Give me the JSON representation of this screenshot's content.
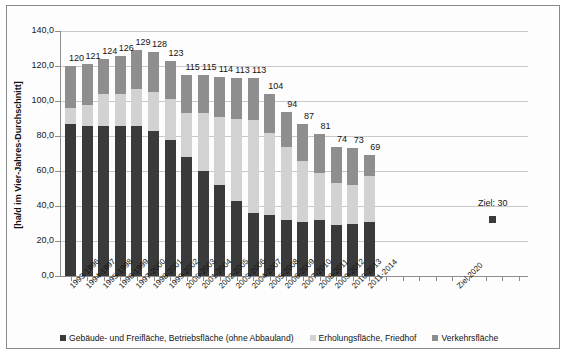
{
  "chart_data": {
    "type": "bar",
    "title": "",
    "subtitle": "",
    "xlabel": "",
    "ylabel": "[ha/d im Vier-Jahres-Durchschnitt]",
    "ylim": [
      0,
      140
    ],
    "ytick_step": 20,
    "ytick_labels": [
      "0,0",
      "20,0",
      "40,0",
      "60,0",
      "80,0",
      "100,0",
      "120,0",
      "140,0"
    ],
    "ytick_values": [
      0,
      20,
      40,
      60,
      80,
      100,
      120,
      140
    ],
    "grid": true,
    "legend_position": "bottom",
    "stacked": true,
    "categories": [
      "1993-1996",
      "1994-1997",
      "1995-1998",
      "1996-1999",
      "1997-2000",
      "1998-2001",
      "1999-2002",
      "2000-2003",
      "2001-2004",
      "2002-2005",
      "2003-2006",
      "2004-2007",
      "2005-2008",
      "2006-2009",
      "2007-2010",
      "2008-2011",
      "2009-2012",
      "2010-2013",
      "2011-2014"
    ],
    "extra_category": "Ziel 2020",
    "series": [
      {
        "name": "Gebäude- und Freifläche, Betriebsfläche (ohne Abbauland)",
        "color": "#3a3a3a",
        "values": [
          87,
          86,
          86,
          86,
          86,
          83,
          78,
          68,
          60,
          52,
          43,
          36,
          35,
          32,
          31,
          32,
          29,
          30,
          31
        ]
      },
      {
        "name": "Erholungsfläche, Friedhof",
        "color": "#d2d2d2",
        "values": [
          9,
          12,
          18,
          18,
          21,
          22,
          23,
          25,
          33,
          39,
          47,
          53,
          47,
          42,
          35,
          27,
          24,
          22,
          26
        ]
      },
      {
        "name": "Verkehrsfläche",
        "color": "#8e8e8e",
        "values": [
          24,
          23,
          20,
          22,
          22,
          23,
          22,
          22,
          22,
          23,
          23,
          24,
          22,
          20,
          21,
          22,
          21,
          21,
          12
        ]
      }
    ],
    "totals": [
      120,
      121,
      124,
      126,
      129,
      128,
      123,
      115,
      115,
      114,
      113,
      113,
      104,
      94,
      87,
      81,
      74,
      73,
      69
    ],
    "data_labels": [
      "120",
      "121",
      "124",
      "126",
      "129",
      "128",
      "123",
      "115",
      "115",
      "114",
      "113",
      "113",
      "104",
      "94",
      "87",
      "81",
      "74",
      "73",
      "69"
    ],
    "annotation": {
      "label": "Ziel: 30",
      "value": 30,
      "marker_color": "#3a3a3a"
    }
  },
  "legend": {
    "items": [
      {
        "label": "Gebäude- und Freifläche, Betriebsfläche (ohne Abbauland)",
        "color": "#3a3a3a"
      },
      {
        "label": "Erholungsfläche, Friedhof",
        "color": "#d2d2d2"
      },
      {
        "label": "Verkehrsfläche",
        "color": "#8e8e8e"
      }
    ]
  }
}
